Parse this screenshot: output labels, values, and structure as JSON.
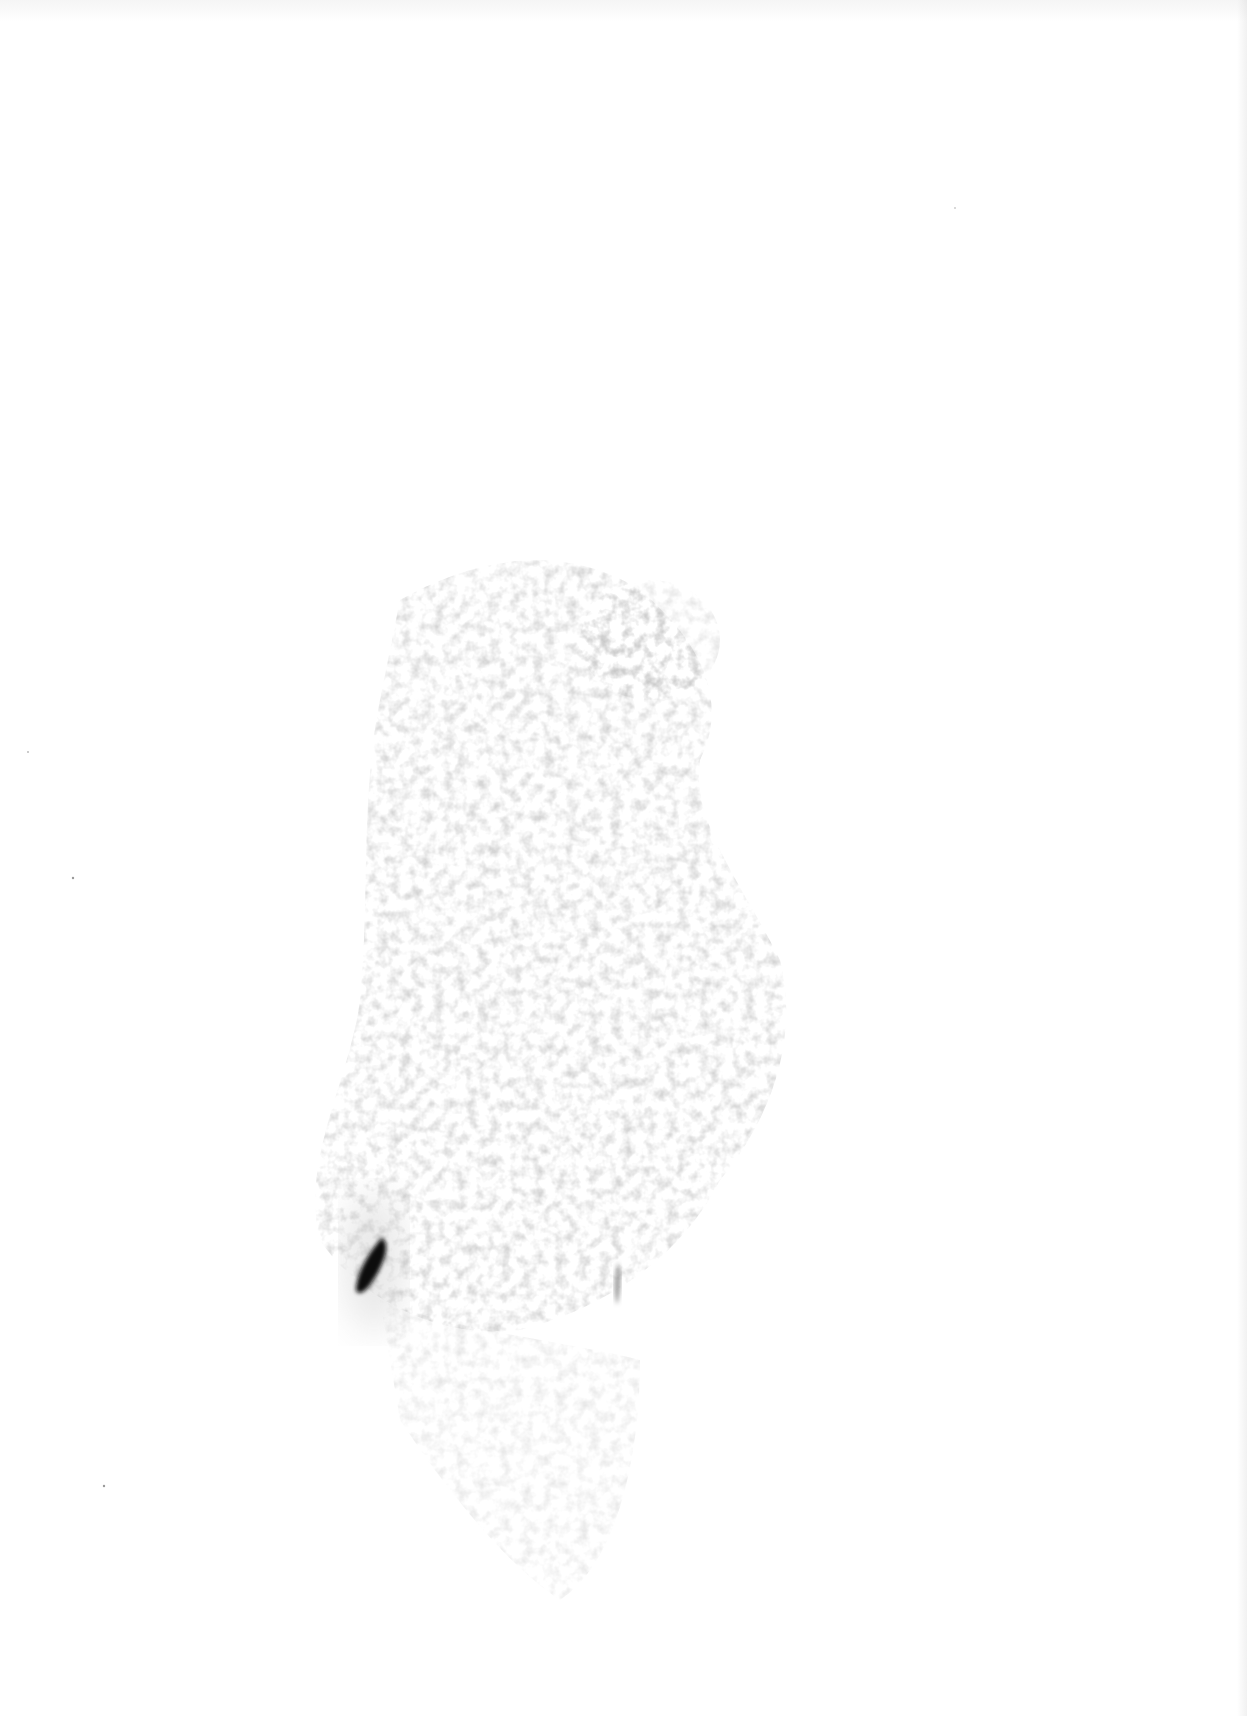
{
  "image": {
    "description": "Faint gray speckled smear on white background with a dark elongated streak near lower-left",
    "background_color": "#ffffff",
    "smear_color": "#9a9a9a",
    "streak_color": "#111111"
  }
}
